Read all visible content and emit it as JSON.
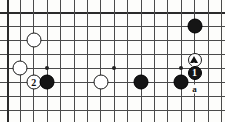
{
  "figure": {
    "type": "go-board-diagram",
    "width": 225,
    "height": 122,
    "background_color": "#fdfdfb",
    "line_color": "#4a4a4a",
    "edge_color": "#2a2a2a"
  },
  "grid": {
    "origin_x": 7,
    "origin_y": 12,
    "spacing_x": 13.4,
    "spacing_y": 14,
    "columns": 17,
    "rows": 8,
    "note": "partial board crop; lines run to the image edges"
  },
  "hoshi_points": [
    {
      "name": "star-point-left",
      "col": 3,
      "row": 4
    },
    {
      "name": "star-point-center",
      "col": 8,
      "row": 4
    },
    {
      "name": "star-point-right",
      "col": 13,
      "row": 4
    }
  ],
  "stones": [
    {
      "id": "w-a",
      "color": "white",
      "col": 2,
      "row": 2,
      "label": "",
      "marker": "",
      "radius": 7.5
    },
    {
      "id": "w-b",
      "color": "white",
      "col": 1,
      "row": 4,
      "label": "",
      "marker": "",
      "radius": 7.5
    },
    {
      "id": "w-2",
      "color": "white",
      "col": 2,
      "row": 5,
      "label": "2",
      "marker": "",
      "radius": 7.5
    },
    {
      "id": "b-a",
      "color": "black",
      "col": 3,
      "row": 5,
      "label": "",
      "marker": "",
      "radius": 7.5
    },
    {
      "id": "w-c",
      "color": "white",
      "col": 7,
      "row": 5,
      "label": "",
      "marker": "",
      "radius": 7.5
    },
    {
      "id": "b-b",
      "color": "black",
      "col": 10,
      "row": 5,
      "label": "",
      "marker": "",
      "radius": 7.5
    },
    {
      "id": "b-c",
      "color": "black",
      "col": 13,
      "row": 5,
      "label": "",
      "marker": "",
      "radius": 7.5
    },
    {
      "id": "b-top",
      "color": "black",
      "col": 14,
      "row": 1,
      "label": "",
      "marker": "",
      "radius": 7.5
    },
    {
      "id": "w-tri",
      "color": "white",
      "col": 14,
      "row": 3.45,
      "label": "",
      "marker": "triangle",
      "radius": 7
    },
    {
      "id": "b-1",
      "color": "black",
      "col": 14,
      "row": 4.35,
      "label": "1",
      "marker": "",
      "radius": 7
    }
  ],
  "point_labels": [
    {
      "id": "label-a",
      "text": "a",
      "col": 14,
      "row": 5.5
    }
  ],
  "legend": {
    "move_1": "1",
    "move_2": "2",
    "point_a": "a",
    "marked_stone": "triangle-marked white stone"
  }
}
